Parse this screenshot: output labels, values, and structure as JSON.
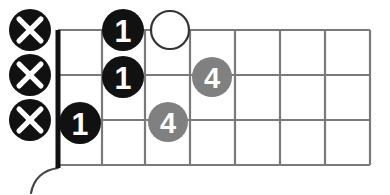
{
  "diagram": {
    "type": "guitar-chord-diagram",
    "title": "",
    "orientation": "horizontal",
    "colors": {
      "background": "#ffffff",
      "grid_line": "#7a7a7a",
      "nut": "#111111",
      "string_line": "#7a7a7a",
      "marker_fill_black": "#111111",
      "marker_fill_gray": "#808080",
      "marker_stroke_open": "#333333",
      "marker_text": "#ffffff",
      "body_curve": "#444444"
    },
    "grid": {
      "nut_x": 58,
      "fret_lines_x": [
        102,
        145,
        190,
        235,
        280,
        325,
        370
      ],
      "string_lines_y": [
        30,
        75,
        120,
        165
      ],
      "fret_count": 7,
      "string_count": 4
    },
    "muted_strings": [
      {
        "label": "X",
        "name": "muted-string-1",
        "cx": 30,
        "cy": 30,
        "r": 21,
        "style": "black"
      },
      {
        "label": "X",
        "name": "muted-string-2",
        "cx": 30,
        "cy": 75,
        "r": 21,
        "style": "black"
      },
      {
        "label": "X",
        "name": "muted-string-3",
        "cx": 30,
        "cy": 120,
        "r": 21,
        "style": "black"
      }
    ],
    "finger_markers": [
      {
        "label": "1",
        "name": "finger-marker-1-fret2-string1",
        "cx": 123,
        "cy": 30,
        "r": 21,
        "style": "black",
        "fret": 2,
        "string": 1
      },
      {
        "label": "",
        "name": "open-marker-fret3-string1",
        "cx": 170,
        "cy": 30,
        "r": 19,
        "style": "open",
        "fret": 3,
        "string": 1
      },
      {
        "label": "1",
        "name": "finger-marker-1-fret2-string2",
        "cx": 123,
        "cy": 77,
        "r": 21,
        "style": "black",
        "fret": 2,
        "string": 2
      },
      {
        "label": "4",
        "name": "finger-marker-4-fret4-string2",
        "cx": 212,
        "cy": 77,
        "r": 20,
        "style": "gray",
        "fret": 4,
        "string": 2
      },
      {
        "label": "1",
        "name": "finger-marker-1-fret1-string3",
        "cx": 80,
        "cy": 123,
        "r": 21,
        "style": "black",
        "fret": 1,
        "string": 3
      },
      {
        "label": "4",
        "name": "finger-marker-4-fret3-string3",
        "cx": 168,
        "cy": 122,
        "r": 20,
        "style": "gray",
        "fret": 3,
        "string": 3
      }
    ],
    "body_curve": {
      "name": "guitar-body-curve",
      "path": "M 58 168 C 44 170, 34 178, 31 193"
    }
  }
}
